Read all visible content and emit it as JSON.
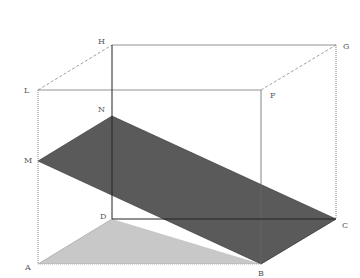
{
  "figure": {
    "colors": {
      "edge": "#555555",
      "solid_edge": "#222222",
      "hidden_edge": "#888888",
      "section_fill": "#5a5a5a",
      "base_fill": "#c8c8c8"
    }
  },
  "points": {
    "A": {
      "label": "A",
      "x": 38,
      "y": 264
    },
    "B": {
      "label": "B",
      "x": 261,
      "y": 264
    },
    "C": {
      "label": "C",
      "x": 336,
      "y": 219
    },
    "D": {
      "label": "D",
      "x": 112,
      "y": 219
    },
    "L": {
      "label": "L",
      "x": 38,
      "y": 90
    },
    "F": {
      "label": "F",
      "x": 261,
      "y": 90
    },
    "G": {
      "label": "G",
      "x": 336,
      "y": 45
    },
    "H": {
      "label": "H",
      "x": 112,
      "y": 45
    },
    "M": {
      "label": "M",
      "x": 38,
      "y": 161
    },
    "N": {
      "label": "N",
      "x": 112,
      "y": 116
    }
  },
  "labels": {
    "A": "A",
    "B": "B",
    "C": "C",
    "D": "D",
    "F": "F",
    "G": "G",
    "H": "H",
    "L": "L",
    "M": "M",
    "N": "N"
  }
}
